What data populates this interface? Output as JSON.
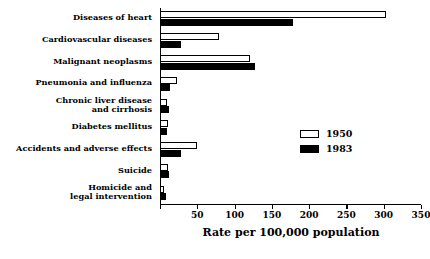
{
  "chart_data": {
    "type": "bar",
    "orientation": "horizontal",
    "title": "",
    "xlabel": "Rate per 100,000 population",
    "ylabel": "",
    "xlim": [
      0,
      350
    ],
    "xticks": [
      0,
      50,
      100,
      150,
      200,
      250,
      300,
      350
    ],
    "xticklabels": [
      "",
      "50",
      "100",
      "150",
      "200",
      "250",
      "300",
      "350"
    ],
    "grid": false,
    "legend_position": "center-right",
    "categories": [
      "Diseases of heart",
      "Cardiovascular diseases",
      "Malignant neoplasms",
      "Pneumonia and influenza",
      "Chronic liver disease\nand cirrhosis",
      "Diabetes mellitus",
      "Accidents and adverse effects",
      "Suicide",
      "Homicide and\nlegal intervention"
    ],
    "series": [
      {
        "name": "1950",
        "color": "#ffffff",
        "values": [
          303,
          79,
          121,
          23,
          10,
          11,
          50,
          11,
          5
        ]
      },
      {
        "name": "1983",
        "color": "#000000",
        "values": [
          178,
          28,
          128,
          13,
          12,
          10,
          28,
          12,
          8
        ]
      }
    ]
  },
  "legend": {
    "entries": [
      {
        "label": "1950",
        "swatch": "open-white-bar"
      },
      {
        "label": "1983",
        "swatch": "filled-black-bar"
      }
    ]
  },
  "axis": {
    "x_title": "Rate per 100,000 population"
  }
}
